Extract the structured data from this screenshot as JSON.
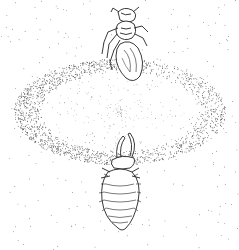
{
  "illustration": {
    "subject": "antlion larva pit with ant",
    "style": "stipple pen drawing",
    "colors": {
      "background": "#ffffff",
      "ink": "#222222"
    },
    "pit": {
      "cx": 120,
      "cy": 112,
      "rx": 100,
      "ry": 50
    },
    "ant": {
      "x": 130,
      "y": 55
    },
    "larva": {
      "x": 128,
      "y": 195
    }
  }
}
